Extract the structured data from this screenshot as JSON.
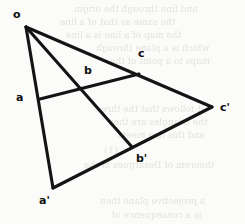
{
  "figure": {
    "kind": "line-diagram",
    "canvas": {
      "width": 245,
      "height": 224
    },
    "ink_color": "#141414",
    "paper_color": "#fbfbf9",
    "bleed_color": "#cfcdc8",
    "points": [
      {
        "id": "o",
        "label": "o",
        "x": 26,
        "y": 27,
        "label_x": 13,
        "label_y": 9
      },
      {
        "id": "a",
        "label": "a",
        "x": 40,
        "y": 99,
        "label_x": 16,
        "label_y": 92
      },
      {
        "id": "b",
        "label": "b",
        "x": 82,
        "y": 89,
        "label_x": 84,
        "label_y": 65
      },
      {
        "id": "c",
        "label": "c",
        "x": 139,
        "y": 74,
        "label_x": 138,
        "label_y": 48
      },
      {
        "id": "a1",
        "label": "a'",
        "x": 53,
        "y": 188,
        "label_x": 39,
        "label_y": 195
      },
      {
        "id": "b1",
        "label": "b'",
        "x": 132,
        "y": 147,
        "label_x": 136,
        "label_y": 153
      },
      {
        "id": "c1",
        "label": "c'",
        "x": 212,
        "y": 107,
        "label_x": 220,
        "label_y": 102
      }
    ],
    "segments": [
      {
        "id": "o-a1",
        "name": "ray-o-through-a-to-a-prime",
        "from": "o",
        "to": "a1"
      },
      {
        "id": "o-b1",
        "name": "ray-o-through-b-to-b-prime",
        "from": "o",
        "to": "b1"
      },
      {
        "id": "o-c1",
        "name": "ray-o-through-c-to-c-prime",
        "from": "o",
        "to": "c1"
      },
      {
        "id": "a-c",
        "name": "line-a-b-c",
        "from": "a",
        "to": "c"
      },
      {
        "id": "a1-c1",
        "name": "line-a-prime-b-prime-c-prime",
        "from": "a1",
        "to": "c1"
      }
    ],
    "bleed_text": [
      {
        "text": "and line through the origin",
        "x": 74,
        "y": 4,
        "size": 9
      },
      {
        "text": "the same as that of a line",
        "x": 60,
        "y": 17,
        "size": 9
      },
      {
        "text": "the map of a line is a line",
        "x": 66,
        "y": 30,
        "size": 9
      },
      {
        "text": "which is a plane through",
        "x": 96,
        "y": 43,
        "size": 9
      },
      {
        "text": "maps to a point of the",
        "x": 110,
        "y": 56,
        "size": 9
      },
      {
        "text": "it follows that the three",
        "x": 96,
        "y": 104,
        "size": 9
      },
      {
        "text": "the triangles are then",
        "x": 108,
        "y": 117,
        "size": 9
      },
      {
        "text": "and this line meets",
        "x": 118,
        "y": 130,
        "size": 9
      },
      {
        "text": "(1)",
        "x": 104,
        "y": 144,
        "size": 10
      },
      {
        "text": "theorem of Desargues in the",
        "x": 84,
        "y": 160,
        "size": 9
      },
      {
        "text": "a projective plane then",
        "x": 100,
        "y": 196,
        "size": 9
      },
      {
        "text": "is a consequence of",
        "x": 112,
        "y": 210,
        "size": 9
      }
    ]
  }
}
